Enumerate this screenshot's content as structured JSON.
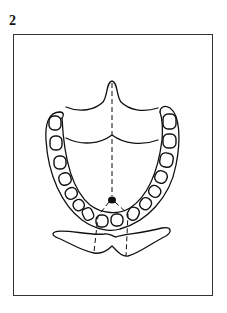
{
  "figure": {
    "label": "2"
  },
  "diagram": {
    "elements": [
      "tongue-outline",
      "midline-dashed",
      "dental-arch",
      "teeth",
      "reference-dot",
      "projection-dashed-lines",
      "lip-outline"
    ],
    "colors": {
      "line": "#111111",
      "frame": "#333333",
      "background": "#ffffff"
    }
  }
}
